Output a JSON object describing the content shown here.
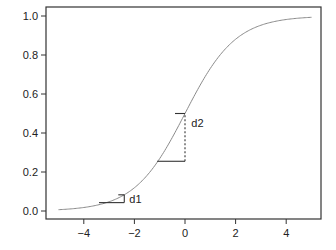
{
  "chart_data": {
    "type": "line",
    "title": "",
    "xlabel": "",
    "ylabel": "",
    "xlim": [
      -5.4,
      5.4
    ],
    "ylim": [
      -0.02,
      1.03
    ],
    "grid": false,
    "legend": null,
    "x_ticks": [
      -4,
      -2,
      0,
      2,
      4
    ],
    "x_tick_labels": [
      "−4",
      "−2",
      "0",
      "2",
      "4"
    ],
    "y_ticks": [
      0.0,
      0.2,
      0.4,
      0.6,
      0.8,
      1.0
    ],
    "y_tick_labels": [
      "0.0",
      "0.2",
      "0.4",
      "0.6",
      "0.8",
      "1.0"
    ],
    "series": [
      {
        "name": "logistic",
        "function": "1/(1+exp(-x))",
        "x": [
          -5,
          -4,
          -3,
          -2,
          -1,
          0,
          1,
          2,
          3,
          4,
          5
        ],
        "values": [
          0.007,
          0.018,
          0.047,
          0.119,
          0.269,
          0.5,
          0.731,
          0.881,
          0.953,
          0.982,
          0.993
        ],
        "color": "#8a8a8a"
      }
    ],
    "annotations": [
      {
        "label": "d1",
        "x_start": -3.4,
        "x_end": -2.4,
        "y_base": 0.043,
        "y_top": 0.083,
        "text_x": -2.2,
        "text_y": 0.06
      },
      {
        "label": "d2",
        "x_start": -1.1,
        "x_end": 0,
        "y_base": 0.255,
        "y_top": 0.5,
        "dashed_vertical": true,
        "text_x": 0.25,
        "text_y": 0.45
      }
    ]
  }
}
